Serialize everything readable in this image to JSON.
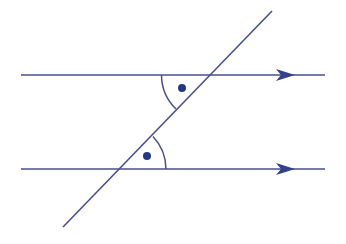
{
  "diagram": {
    "title": "Alternate angles between parallel lines",
    "colors": {
      "background": "#ffffff",
      "line": "#4a4f8f",
      "arrow": "#33408a",
      "dot": "#24388a"
    },
    "parallel_lines": [
      {
        "name": "top-parallel-line",
        "x1": 21,
        "x2": 325,
        "y": 75,
        "arrow_tip_x": 295
      },
      {
        "name": "bottom-parallel-line",
        "x1": 21,
        "x2": 325,
        "y": 169,
        "arrow_tip_x": 295
      }
    ],
    "transversal": {
      "x1": 272,
      "y1": 11,
      "x2": 63,
      "y2": 227
    },
    "angles": [
      {
        "name": "top-angle",
        "vertex": [
          209,
          75
        ],
        "arc": "M 161.5 75 A 47.5 47.5 0 0 0 176 109",
        "dot": [
          182,
          88
        ]
      },
      {
        "name": "bottom-angle",
        "vertex": [
          118,
          169
        ],
        "arc": "M 166 169 A 48 48 0 0 0 153 136.5",
        "dot": [
          147,
          156
        ]
      }
    ]
  }
}
